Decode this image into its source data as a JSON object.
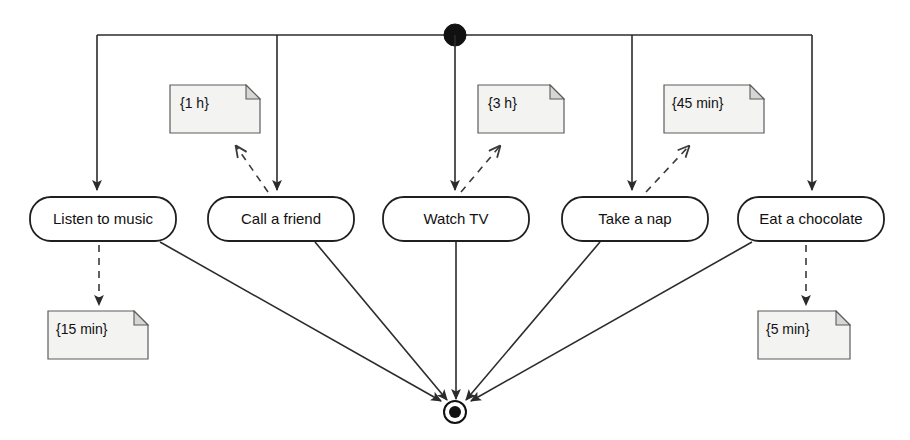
{
  "diagram": {
    "type": "uml-activity-diagram",
    "canvas": {
      "width": 910,
      "height": 440
    },
    "background_color": "#ffffff",
    "line_color": "#2b2b2b",
    "note_fill_color": "#f3f3f1",
    "note_fold_color": "#d6d6d4",
    "activity_fill_color": "#ffffff",
    "activity_stroke_color": "#1f1f1f"
  },
  "initial_node": {
    "name": "initial-node",
    "shape": "filled-circle",
    "cx": 455,
    "cy": 35,
    "r": 11,
    "color": "#111111"
  },
  "final_node": {
    "name": "final-node",
    "shape": "bullseye",
    "cx": 455,
    "cy": 412,
    "outer_r": 11,
    "inner_r": 6,
    "color": "#111111"
  },
  "fork_bar": {
    "name": "fork-bar",
    "y": 35,
    "x_start": 97,
    "x_end": 812,
    "branch_x": [
      97,
      277,
      455,
      632,
      812
    ]
  },
  "activities": [
    {
      "id": "listen-to-music",
      "label": "Listen to music",
      "x": 30,
      "y": 197,
      "width": 146,
      "height": 44,
      "cx": 103,
      "cy": 219
    },
    {
      "id": "call-a-friend",
      "label": "Call a friend",
      "x": 208,
      "y": 197,
      "width": 146,
      "height": 44,
      "cx": 281,
      "cy": 219
    },
    {
      "id": "watch-tv",
      "label": "Watch TV",
      "x": 383,
      "y": 197,
      "width": 146,
      "height": 44,
      "cx": 456,
      "cy": 219
    },
    {
      "id": "take-a-nap",
      "label": "Take a nap",
      "x": 562,
      "y": 197,
      "width": 146,
      "height": 44,
      "cx": 635,
      "cy": 219
    },
    {
      "id": "eat-a-chocolate",
      "label": "Eat a chocolate",
      "x": 738,
      "y": 197,
      "width": 146,
      "height": 44,
      "cx": 811,
      "cy": 219
    }
  ],
  "notes": [
    {
      "id": "note-1h",
      "label": "{1 h}",
      "x": 170,
      "y": 85,
      "width": 90,
      "height": 48,
      "attached_to": "call-a-friend",
      "position": "above"
    },
    {
      "id": "note-3h",
      "label": "{3 h}",
      "x": 478,
      "y": 85,
      "width": 86,
      "height": 48,
      "attached_to": "watch-tv",
      "position": "above"
    },
    {
      "id": "note-45min",
      "label": "{45 min}",
      "x": 664,
      "y": 85,
      "width": 100,
      "height": 48,
      "attached_to": "take-a-nap",
      "position": "above"
    },
    {
      "id": "note-15min",
      "label": "{15 min}",
      "x": 48,
      "y": 311,
      "width": 100,
      "height": 48,
      "attached_to": "listen-to-music",
      "position": "below"
    },
    {
      "id": "note-5min",
      "label": "{5 min}",
      "x": 758,
      "y": 311,
      "width": 92,
      "height": 48,
      "attached_to": "eat-a-chocolate",
      "position": "below"
    }
  ],
  "flows_in": [
    {
      "id": "flow-to-listen-to-music",
      "from": "fork-bar",
      "to": "listen-to-music",
      "style": "solid",
      "arrow": true
    },
    {
      "id": "flow-to-call-a-friend",
      "from": "fork-bar",
      "to": "call-a-friend",
      "style": "solid",
      "arrow": true
    },
    {
      "id": "flow-to-watch-tv",
      "from": "fork-bar",
      "to": "watch-tv",
      "style": "solid",
      "arrow": true
    },
    {
      "id": "flow-to-take-a-nap",
      "from": "fork-bar",
      "to": "take-a-nap",
      "style": "solid",
      "arrow": true
    },
    {
      "id": "flow-to-eat-a-chocolate",
      "from": "fork-bar",
      "to": "eat-a-chocolate",
      "style": "solid",
      "arrow": true
    }
  ],
  "flows_out": [
    {
      "id": "flow-listen-to-music-to-final",
      "from": "listen-to-music",
      "to": "final-node",
      "style": "solid",
      "arrow": true
    },
    {
      "id": "flow-call-a-friend-to-final",
      "from": "call-a-friend",
      "to": "final-node",
      "style": "solid",
      "arrow": true
    },
    {
      "id": "flow-watch-tv-to-final",
      "from": "watch-tv",
      "to": "final-node",
      "style": "solid",
      "arrow": true
    },
    {
      "id": "flow-take-a-nap-to-final",
      "from": "take-a-nap",
      "to": "final-node",
      "style": "solid",
      "arrow": true
    },
    {
      "id": "flow-eat-a-chocolate-to-final",
      "from": "eat-a-chocolate",
      "to": "final-node",
      "style": "solid",
      "arrow": true
    }
  ],
  "note_anchors": [
    {
      "id": "anchor-1h",
      "note": "note-1h",
      "target": "call-a-friend",
      "style": "dashed",
      "arrow": true
    },
    {
      "id": "anchor-3h",
      "note": "note-3h",
      "target": "watch-tv",
      "style": "dashed",
      "arrow": true
    },
    {
      "id": "anchor-45min",
      "note": "note-45min",
      "target": "take-a-nap",
      "style": "dashed",
      "arrow": true
    },
    {
      "id": "anchor-15min",
      "note": "note-15min",
      "target": "listen-to-music",
      "style": "dashed",
      "arrow": true
    },
    {
      "id": "anchor-5min",
      "note": "note-5min",
      "target": "eat-a-chocolate",
      "style": "dashed",
      "arrow": true
    }
  ]
}
